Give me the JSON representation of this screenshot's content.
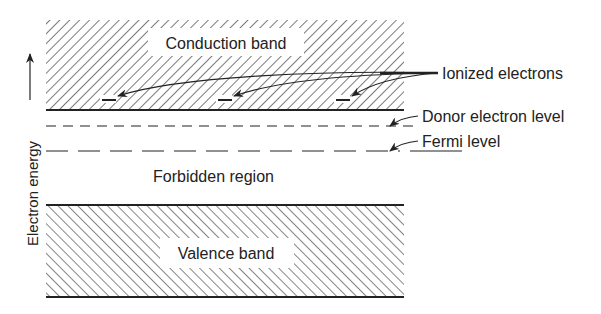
{
  "diagram": {
    "type": "energy-band diagram (n-type semiconductor)",
    "axis": {
      "label": "Electron energy",
      "direction": "up"
    },
    "bands": {
      "conduction": {
        "label": "Conduction band",
        "hatch": "forward-diagonal"
      },
      "forbidden": {
        "label": "Forbidden region"
      },
      "valence": {
        "label": "Valence band",
        "hatch": "back-diagonal"
      }
    },
    "levels": {
      "donor": {
        "label": "Donor electron level",
        "style": "short-dashed"
      },
      "fermi": {
        "label": "Fermi level",
        "style": "long-dashed"
      }
    },
    "annotations": {
      "ionized": {
        "label": "Ionized electrons",
        "count": 3,
        "symbol": "–"
      }
    },
    "colors": {
      "ink": "#222222",
      "background": "#ffffff"
    }
  }
}
